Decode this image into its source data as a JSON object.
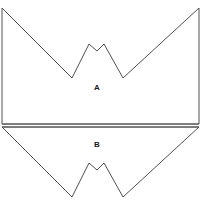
{
  "figure": {
    "background_color": "#ffffff",
    "stroke_color": "#3c3c3c",
    "divider_color": "#555555",
    "label_color": "#1a1a1a",
    "stroke_width": 0.9,
    "width": 207,
    "height": 223
  },
  "chart_data": {
    "type": "diagram",
    "title": "",
    "subtitle": "",
    "xlabel": "",
    "ylabel": "",
    "grid": false,
    "legend": "none",
    "xlim": [
      0,
      207
    ],
    "ylim": [
      0,
      223
    ],
    "shapes": [
      {
        "name": "A",
        "label": "A",
        "label_x": 97,
        "label_y": 88,
        "orientation": "notch-opens-downward",
        "fill": "none",
        "points": [
          [
            2,
            8
          ],
          [
            72,
            78
          ],
          [
            89,
            44
          ],
          [
            97,
            51
          ],
          [
            104,
            44
          ],
          [
            123,
            78
          ],
          [
            199,
            8
          ],
          [
            199,
            124
          ],
          [
            2,
            124
          ]
        ]
      },
      {
        "name": "B",
        "label": "B",
        "label_x": 97,
        "label_y": 145,
        "orientation": "notch-opens-upward",
        "fill": "none",
        "points": [
          [
            2,
            127
          ],
          [
            72,
            197
          ],
          [
            89,
            163
          ],
          [
            97,
            170
          ],
          [
            104,
            163
          ],
          [
            123,
            197
          ],
          [
            199,
            127
          ]
        ]
      }
    ],
    "divider": {
      "name": "horizontal-divider",
      "y_top": 124,
      "y_bottom": 127,
      "x_start": 2,
      "x_end": 199
    },
    "annotations": [
      {
        "text": "A",
        "x": 97,
        "y": 88
      },
      {
        "text": "B",
        "x": 97,
        "y": 145
      }
    ],
    "caption": {
      "text": "",
      "x": 103,
      "y": 216
    }
  },
  "labels": {
    "shape_a": "A",
    "shape_b": "B"
  }
}
